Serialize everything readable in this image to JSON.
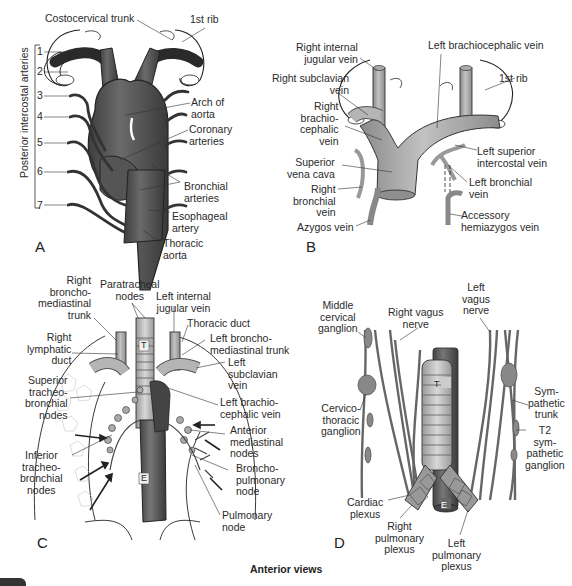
{
  "figure": {
    "caption": "Anterior views",
    "panels": {
      "A": {
        "letter": "A",
        "vertical_label": "Posterior intercostal arteries",
        "numbers": [
          "1",
          "2",
          "3",
          "4",
          "5",
          "6",
          "7"
        ],
        "labels": {
          "costocervical_trunk": "Costocervical trunk",
          "first_rib": "1st rib",
          "arch_of_aorta": "Arch of\naorta",
          "coronary_arteries": "Coronary\narteries",
          "bronchial_arteries": "Bronchial\narteries",
          "esophageal_artery": "Esophageal\nartery",
          "thoracic_aorta": "Thoracic\naorta"
        }
      },
      "B": {
        "letter": "B",
        "labels": {
          "right_internal_jugular_vein": "Right internal\njugular vein",
          "left_brachiocephalic_vein": "Left brachiocephalic vein",
          "right_subclavian_vein": "Right subclavian\nvein",
          "first_rib": "1st rib",
          "right_brachiocephalic_vein": "Right\nbrachio-\ncephalic\nvein",
          "left_superior_intercostal_vein": "Left superior\nintercostal vein",
          "superior_vena_cava": "Superior\nvena cava",
          "left_bronchial_vein": "Left bronchial\nvein",
          "right_bronchial_vein": "Right\nbronchial\nvein",
          "azygos_vein": "Azygos vein",
          "accessory_hemiazygos_vein": "Accessory\nhemiazygos vein"
        }
      },
      "C": {
        "letter": "C",
        "trachea_marker": "T",
        "esophagus_marker": "E",
        "labels": {
          "right_bronchomediastinal_trunk": "Right\nbroncho-\nmediastinal\ntrunk",
          "paratracheal_nodes": "Paratracheal\nnodes",
          "left_internal_jugular_vein": "Left internal\njugular vein",
          "thoracic_duct": "Thoracic duct",
          "right_lymphatic_duct": "Right\nlymphatic\nduct",
          "left_bronchomediastinal_trunk": "Left broncho-\nmediastinal trunk",
          "left_subclavian_vein": "Left\nsubclavian\nvein",
          "superior_tracheobronchial_nodes": "Superior\ntracheo-\nbronchial\nnodes",
          "left_brachiocephalic_vein": "Left brachio-\ncephalic vein",
          "anterior_mediastinal_nodes": "Anterior\nmediastinal\nnodes",
          "inferior_tracheobronchial_nodes": "Inferior\ntracheo-\nbronchial\nnodes",
          "bronchopulmonary_node": "Broncho-\npulmonary\nnode",
          "pulmonary_node": "Pulmonary\nnode"
        }
      },
      "D": {
        "letter": "D",
        "trachea_marker": "T",
        "esophagus_marker": "E",
        "labels": {
          "middle_cervical_ganglion": "Middle\ncervical\nganglion",
          "right_vagus_nerve": "Right vagus\nnerve",
          "left_vagus_nerve": "Left\nvagus\nnerve",
          "cervicothoracic_ganglion": "Cervico-\nthoracic\nganglion",
          "sympathetic_trunk": "Sym-\npathetic\ntrunk",
          "t2_sympathetic_ganglion": "T2\nsym-\npathetic\nganglion",
          "cardiac_plexus": "Cardiac\nplexus",
          "right_pulmonary_plexus": "Right\npulmonary\nplexus",
          "left_pulmonary_plexus": "Left\npulmonary\nplexus"
        }
      }
    },
    "colors": {
      "artery": "#5a5a5a",
      "vein": "#9a9a9a",
      "outline": "#222222",
      "background": "#ffffff"
    }
  }
}
